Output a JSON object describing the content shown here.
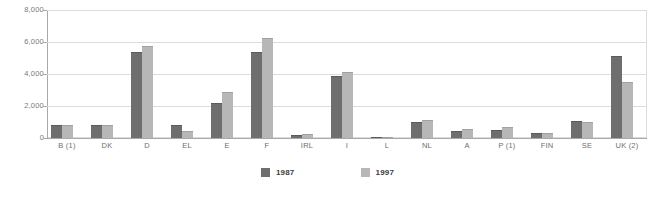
{
  "chart_data": {
    "type": "bar",
    "title": "",
    "xlabel": "",
    "ylabel": "",
    "ylim": [
      0,
      8000
    ],
    "grid": true,
    "legend_position": "bottom",
    "categories": [
      "B (1)",
      "DK",
      "D",
      "EL",
      "E",
      "F",
      "IRL",
      "I",
      "L",
      "NL",
      "A",
      "P (1)",
      "FIN",
      "SE",
      "UK (2)"
    ],
    "yticks": [
      "0",
      "2,000",
      "4,000",
      "6,000",
      "8,000"
    ],
    "ytick_values": [
      0,
      2000,
      4000,
      6000,
      8000
    ],
    "series": [
      {
        "name": "1987",
        "color": "#6e6e6e",
        "values": [
          800,
          800,
          5400,
          800,
          2200,
          5400,
          200,
          3900,
          30,
          1000,
          450,
          500,
          300,
          1050,
          5100
        ]
      },
      {
        "name": "1997",
        "color": "#b7b7b7",
        "values": [
          800,
          820,
          5750,
          450,
          2900,
          6250,
          280,
          4100,
          40,
          1150,
          550,
          700,
          300,
          1000,
          3500
        ]
      }
    ]
  },
  "colors": {
    "series_1987": "#6e6e6e",
    "series_1997": "#b7b7b7",
    "gridline": "#dcdcdc",
    "axis": "#a9a9a9",
    "tick_text": "#7a7a7a",
    "legend_text": "#3c3c3c",
    "background": "#ffffff"
  }
}
